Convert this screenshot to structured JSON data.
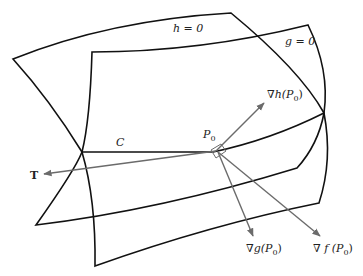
{
  "diagram": {
    "title": "",
    "surfaces": [
      {
        "id": "h",
        "label": "h = 0"
      },
      {
        "id": "g",
        "label": "g = 0"
      }
    ],
    "curve": {
      "label": "C"
    },
    "point": {
      "label": "P0",
      "base": "P",
      "sub": "0"
    },
    "vectors": [
      {
        "id": "T",
        "label": "T"
      },
      {
        "id": "grad_h",
        "label": "∇h(P0)",
        "prefix": "∇h(P",
        "sub": "0",
        "suffix": ")"
      },
      {
        "id": "grad_g",
        "label": "∇g(P0)",
        "prefix": "∇g(P",
        "sub": "0",
        "suffix": ")"
      },
      {
        "id": "grad_f",
        "label": "∇f(P0)",
        "prefix": "∇ f (P",
        "sub": "0",
        "suffix": ")"
      }
    ],
    "colors": {
      "surface_stroke": "#111111",
      "vector_stroke": "#6b6b6b",
      "background": "#ffffff"
    }
  }
}
